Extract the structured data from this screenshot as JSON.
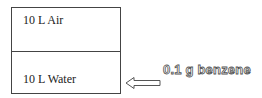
{
  "diagram": {
    "compartments": [
      {
        "label": "10 L Air"
      },
      {
        "label": "10 L Water"
      }
    ],
    "input": {
      "label": "0.1 g benzene",
      "target": "10 L Water",
      "arrow_direction": "left"
    },
    "colors": {
      "border": "#444444",
      "text": "#222222",
      "outline_text_stroke": "#555555"
    }
  }
}
